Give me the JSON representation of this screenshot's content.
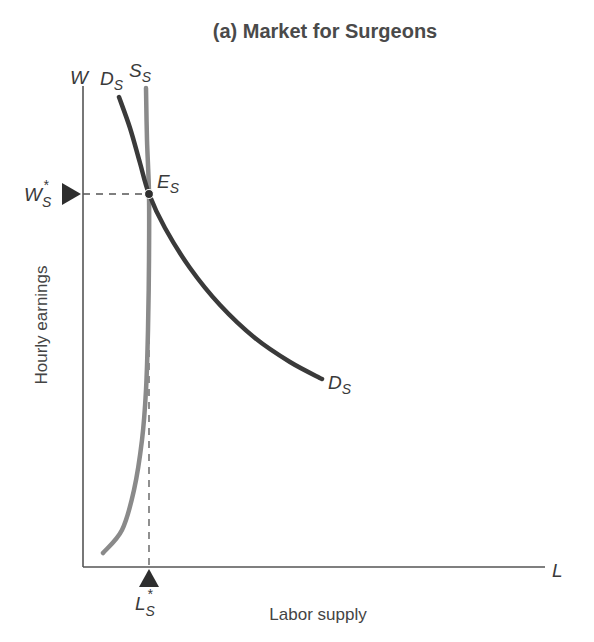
{
  "chart_data": {
    "type": "line",
    "title": "(a) Market for Surgeons",
    "xlabel": "Labor supply",
    "ylabel": "Hourly earnings",
    "x_axis_symbol": "L",
    "y_axis_symbol": "W",
    "grid": false,
    "ticks": "none (qualitative economics diagram)",
    "series": [
      {
        "name": "D_S",
        "label_main": "D",
        "label_sub": "S",
        "description": "Demand for surgeons, downward sloping convex curve",
        "color": "#3a3a3a",
        "points_px": [
          [
            119,
            97
          ],
          [
            130,
            128
          ],
          [
            140,
            163
          ],
          [
            149,
            194
          ],
          [
            165,
            228
          ],
          [
            190,
            268
          ],
          [
            220,
            305
          ],
          [
            255,
            338
          ],
          [
            290,
            362
          ],
          [
            322,
            379
          ]
        ]
      },
      {
        "name": "S_S",
        "label_main": "S",
        "label_sub": "S",
        "description": "Supply of surgeons, nearly vertical (highly inelastic), bending left near bottom",
        "color": "#8a8a8a",
        "points_px": [
          [
            146,
            88
          ],
          [
            147,
            140
          ],
          [
            149,
            194
          ],
          [
            149,
            260
          ],
          [
            148,
            330
          ],
          [
            146,
            390
          ],
          [
            142,
            440
          ],
          [
            134,
            490
          ],
          [
            122,
            530
          ],
          [
            103,
            553
          ]
        ]
      }
    ],
    "equilibrium": {
      "label_main": "E",
      "label_sub": "S",
      "point_px": [
        149,
        194
      ],
      "wage_label_main": "W",
      "wage_label_sub": "S",
      "wage_label_sup": "*",
      "quantity_label_main": "L",
      "quantity_label_sub": "S",
      "quantity_label_sup": "*"
    }
  },
  "colors": {
    "axis": "#555555",
    "demand": "#3a3a3a",
    "supply": "#8a8a8a",
    "guide": "#555555",
    "marker": "#2e2e2e"
  }
}
